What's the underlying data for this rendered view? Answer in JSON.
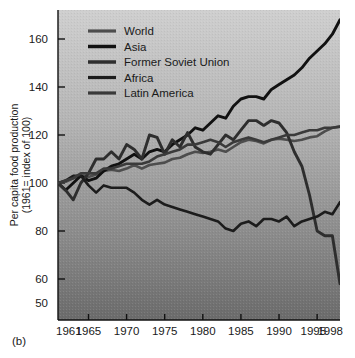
{
  "figure": {
    "panel_label": "(b)",
    "background": "#ffffff",
    "plot_background_top": "#c9c9c9",
    "plot_background_bottom": "#6f6f6f"
  },
  "chart_data": {
    "type": "line",
    "title": "",
    "subtitle": "",
    "xlabel": "",
    "ylabel": "Per capita food production (1961= index of 100)",
    "ylabel_line1": "Per capita food production",
    "ylabel_line2": "(1961= index of 100)",
    "xlim": [
      1961,
      1998
    ],
    "ylim": [
      50,
      168
    ],
    "yticks": [
      50,
      60,
      80,
      100,
      120,
      140,
      160
    ],
    "ytick_labels": [
      "50",
      "60",
      "80",
      "100",
      "120",
      "140",
      "160"
    ],
    "xticks": [
      1961,
      1965,
      1970,
      1975,
      1980,
      1985,
      1990,
      1995,
      1998
    ],
    "xtick_labels": [
      "1961",
      "1965",
      "1970",
      "1975",
      "1980",
      "1985",
      "1990",
      "1995",
      "1998"
    ],
    "grid": false,
    "legend_position": "top-left",
    "x": [
      1961,
      1962,
      1963,
      1964,
      1965,
      1966,
      1967,
      1968,
      1969,
      1970,
      1971,
      1972,
      1973,
      1974,
      1975,
      1976,
      1977,
      1978,
      1979,
      1980,
      1981,
      1982,
      1983,
      1984,
      1985,
      1986,
      1987,
      1988,
      1989,
      1990,
      1991,
      1992,
      1993,
      1994,
      1995,
      1996,
      1997,
      1998
    ],
    "series": [
      {
        "name": "World",
        "color": "#4d4d4d",
        "width": 2.6,
        "values": [
          100,
          100.5,
          102,
          103,
          102.5,
          103.5,
          105,
          105.5,
          105,
          106,
          107.5,
          106,
          107.5,
          108,
          108.5,
          110,
          110.5,
          112,
          113,
          112.5,
          113,
          114,
          113,
          115,
          117,
          118,
          117.5,
          116.5,
          118,
          118.5,
          118,
          117.5,
          118,
          119,
          119.5,
          121.5,
          123,
          123.5
        ]
      },
      {
        "name": "Asia",
        "color": "#111111",
        "width": 2.9,
        "values": [
          100,
          97,
          100,
          103,
          101,
          102,
          105,
          107,
          108,
          110,
          112,
          110,
          113,
          114,
          113,
          116,
          118,
          120,
          123,
          122,
          125,
          128,
          127,
          132,
          135,
          136,
          136,
          135,
          139,
          141,
          143,
          145,
          148,
          152,
          155,
          158,
          162,
          168
        ]
      },
      {
        "name": "Former Soviet Union",
        "color": "#2e2e2e",
        "width": 2.9,
        "values": [
          100,
          97,
          93,
          100,
          104,
          110,
          110,
          113,
          110,
          116,
          114,
          110,
          120,
          119,
          112,
          118,
          115,
          121,
          115,
          113,
          112,
          116,
          120,
          118,
          122,
          126,
          126,
          124,
          126,
          125,
          121,
          113,
          107,
          95,
          80,
          78,
          78,
          58
        ]
      },
      {
        "name": "Africa",
        "color": "#1c1c1c",
        "width": 2.6,
        "values": [
          100,
          101,
          103,
          103,
          99,
          96,
          99,
          98,
          98,
          98,
          96,
          93,
          91,
          93,
          91,
          90,
          89,
          88,
          87,
          86,
          85,
          84,
          81,
          80,
          83,
          84,
          82,
          85,
          85,
          84,
          86,
          82,
          84,
          85,
          86,
          88,
          87,
          92
        ]
      },
      {
        "name": "Latin America",
        "color": "#3a3a3a",
        "width": 2.6,
        "values": [
          100,
          101,
          102,
          104,
          104,
          104,
          106,
          106,
          107,
          108,
          108,
          108,
          109,
          111,
          112,
          113,
          114,
          116,
          116,
          117,
          118,
          117,
          115,
          117,
          118,
          119,
          118,
          117,
          118,
          119,
          120,
          120,
          121,
          122,
          122,
          123,
          123,
          123.5
        ]
      }
    ]
  }
}
